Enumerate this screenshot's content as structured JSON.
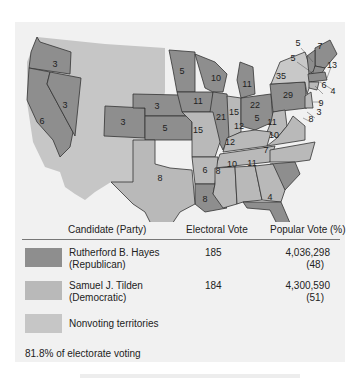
{
  "map": {
    "title": "Presidential Election of 1876",
    "colors": {
      "republican": "#8e8e8e",
      "democratic": "#b9b9b9",
      "nonvoting": "#c6c6c6",
      "border": "#333333",
      "background": "#f1f1f1"
    },
    "states": [
      {
        "name": "Oregon",
        "party": "republican",
        "votes": "3"
      },
      {
        "name": "California",
        "party": "republican",
        "votes": "6"
      },
      {
        "name": "Nevada",
        "party": "republican",
        "votes": "3"
      },
      {
        "name": "Colorado",
        "party": "republican",
        "votes": "3"
      },
      {
        "name": "Nebraska",
        "party": "republican",
        "votes": "3"
      },
      {
        "name": "Kansas",
        "party": "republican",
        "votes": "5"
      },
      {
        "name": "Texas",
        "party": "democratic",
        "votes": "8"
      },
      {
        "name": "Minnesota",
        "party": "republican",
        "votes": "5"
      },
      {
        "name": "Iowa",
        "party": "republican",
        "votes": "11"
      },
      {
        "name": "Missouri",
        "party": "democratic",
        "votes": "15"
      },
      {
        "name": "Arkansas",
        "party": "democratic",
        "votes": "6"
      },
      {
        "name": "Louisiana",
        "party": "republican",
        "votes": "8"
      },
      {
        "name": "Wisconsin",
        "party": "republican",
        "votes": "10"
      },
      {
        "name": "Illinois",
        "party": "republican",
        "votes": "21"
      },
      {
        "name": "Michigan",
        "party": "republican",
        "votes": "11"
      },
      {
        "name": "Indiana",
        "party": "democratic",
        "votes": "15"
      },
      {
        "name": "Ohio",
        "party": "republican",
        "votes": "22"
      },
      {
        "name": "Kentucky",
        "party": "democratic",
        "votes": "12"
      },
      {
        "name": "Tennessee",
        "party": "democratic",
        "votes": "12"
      },
      {
        "name": "Mississippi",
        "party": "democratic",
        "votes": "8"
      },
      {
        "name": "Alabama",
        "party": "democratic",
        "votes": "10"
      },
      {
        "name": "Georgia",
        "party": "democratic",
        "votes": "11"
      },
      {
        "name": "Florida",
        "party": "republican",
        "votes": "4"
      },
      {
        "name": "South Carolina",
        "party": "republican",
        "votes": "7"
      },
      {
        "name": "North Carolina",
        "party": "democratic",
        "votes": "10"
      },
      {
        "name": "Virginia",
        "party": "democratic",
        "votes": "11"
      },
      {
        "name": "West Virginia",
        "party": "democratic",
        "votes": "5"
      },
      {
        "name": "Pennsylvania",
        "party": "republican",
        "votes": "29"
      },
      {
        "name": "New York",
        "party": "democratic",
        "votes": "35"
      },
      {
        "name": "Vermont",
        "party": "republican",
        "votes": "5"
      },
      {
        "name": "New Hampshire",
        "party": "republican",
        "votes": "5"
      },
      {
        "name": "Maine",
        "party": "republican",
        "votes": "7"
      },
      {
        "name": "Massachusetts",
        "party": "republican",
        "votes": "13"
      },
      {
        "name": "Rhode Island",
        "party": "republican",
        "votes": "4"
      },
      {
        "name": "Connecticut",
        "party": "democratic",
        "votes": "6"
      },
      {
        "name": "New Jersey",
        "party": "democratic",
        "votes": "9"
      },
      {
        "name": "Delaware",
        "party": "democratic",
        "votes": "3"
      },
      {
        "name": "Maryland",
        "party": "democratic",
        "votes": "8"
      }
    ]
  },
  "legend": {
    "headers": {
      "candidate": "Candidate (Party)",
      "electoral": "Electoral Vote",
      "popular": "Popular Vote (%)"
    },
    "rows": [
      {
        "name": "Rutherford B. Hayes",
        "party": "(Republican)",
        "electoral": "185",
        "popular": "4,036,298",
        "percent": "(48)"
      },
      {
        "name": "Samuel J. Tilden",
        "party": "(Democratic)",
        "electoral": "184",
        "popular": "4,300,590",
        "percent": "(51)"
      },
      {
        "name": "Nonvoting territories"
      }
    ],
    "footer": "81.8% of electorate voting"
  }
}
